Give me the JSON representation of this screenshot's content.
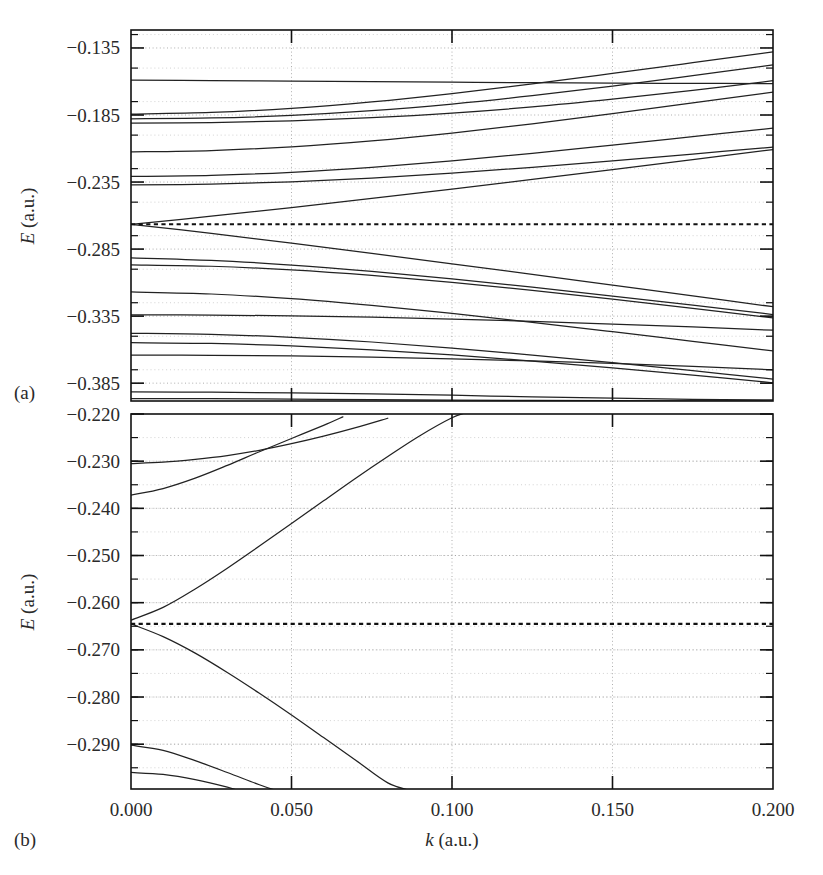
{
  "figure": {
    "panel_a_label": "(a)",
    "panel_b_label": "(b)",
    "xaxis_title_symbol": "k",
    "xaxis_title_units": " (a.u.)",
    "yaxis_title_symbol": "E",
    "yaxis_title_units": " (a.u.)"
  },
  "chart_data": [
    {
      "type": "line",
      "panel": "(a)",
      "title": "",
      "xlabel": "k (a.u.)",
      "ylabel": "E (a.u.)",
      "xlim": [
        0.0,
        0.2
      ],
      "ylim": [
        -0.3983,
        -0.1216
      ],
      "xticks": [
        0.0,
        0.05,
        0.1,
        0.15,
        0.2
      ],
      "xticklabels": [
        "0.000",
        "0.050",
        "0.100",
        "0.150",
        "0.200"
      ],
      "yticks": [
        -0.135,
        -0.185,
        -0.235,
        -0.285,
        -0.335,
        -0.385
      ],
      "yticklabels": [
        "-0.135",
        "-0.185",
        "-0.235",
        "-0.285",
        "-0.335",
        "-0.385"
      ],
      "grid": true,
      "xticks_shown_labels": false,
      "fermi_level": -0.2665,
      "fermi_style": "dotted",
      "series": [
        {
          "name": "band-1",
          "x": [
            0.0,
            0.025,
            0.05,
            0.075,
            0.1,
            0.125,
            0.15,
            0.175,
            0.2
          ],
          "y": [
            -0.159,
            -0.1593,
            -0.1597,
            -0.1601,
            -0.1605,
            -0.1609,
            -0.1612,
            -0.1614,
            -0.1616
          ]
        },
        {
          "name": "band-2",
          "x": [
            0.0,
            0.025,
            0.05,
            0.075,
            0.1,
            0.125,
            0.15,
            0.175,
            0.2
          ],
          "y": [
            -0.1843,
            -0.1831,
            -0.18,
            -0.1752,
            -0.169,
            -0.1618,
            -0.154,
            -0.146,
            -0.1379
          ]
        },
        {
          "name": "band-3",
          "x": [
            0.0,
            0.025,
            0.05,
            0.075,
            0.1,
            0.125,
            0.15,
            0.175,
            0.2
          ],
          "y": [
            -0.1878,
            -0.1872,
            -0.1853,
            -0.1818,
            -0.1768,
            -0.1706,
            -0.1634,
            -0.1556,
            -0.1476
          ]
        },
        {
          "name": "band-4",
          "x": [
            0.0,
            0.025,
            0.05,
            0.075,
            0.1,
            0.125,
            0.15,
            0.175,
            0.2
          ],
          "y": [
            -0.191,
            -0.1906,
            -0.1893,
            -0.187,
            -0.1836,
            -0.179,
            -0.1732,
            -0.1666,
            -0.1594
          ]
        },
        {
          "name": "band-5",
          "x": [
            0.0,
            0.025,
            0.05,
            0.075,
            0.1,
            0.125,
            0.15,
            0.175,
            0.2
          ],
          "y": [
            -0.2125,
            -0.2115,
            -0.2087,
            -0.2043,
            -0.1985,
            -0.1916,
            -0.184,
            -0.176,
            -0.1679
          ]
        },
        {
          "name": "band-6",
          "x": [
            0.0,
            0.025,
            0.05,
            0.075,
            0.1,
            0.125,
            0.15,
            0.175,
            0.2
          ],
          "y": [
            -0.2308,
            -0.23,
            -0.2277,
            -0.224,
            -0.2192,
            -0.2136,
            -0.2074,
            -0.2011,
            -0.1948
          ]
        },
        {
          "name": "band-7",
          "x": [
            0.0,
            0.025,
            0.05,
            0.075,
            0.1,
            0.125,
            0.15,
            0.175,
            0.2
          ],
          "y": [
            -0.2372,
            -0.2366,
            -0.2349,
            -0.2321,
            -0.2284,
            -0.224,
            -0.2192,
            -0.2141,
            -0.209
          ]
        },
        {
          "name": "band-8",
          "x": [
            0.0,
            0.025,
            0.05,
            0.075,
            0.1,
            0.125,
            0.15,
            0.175,
            0.2
          ],
          "y": [
            -0.2665,
            -0.2605,
            -0.254,
            -0.2472,
            -0.2402,
            -0.233,
            -0.2257,
            -0.2183,
            -0.2108
          ]
        },
        {
          "name": "band-9",
          "x": [
            0.0,
            0.025,
            0.05,
            0.075,
            0.1,
            0.125,
            0.15,
            0.175,
            0.2
          ],
          "y": [
            -0.2665,
            -0.2733,
            -0.2806,
            -0.2882,
            -0.296,
            -0.3039,
            -0.3119,
            -0.3199,
            -0.328
          ]
        },
        {
          "name": "band-10",
          "x": [
            0.0,
            0.025,
            0.05,
            0.075,
            0.1,
            0.125,
            0.15,
            0.175,
            0.2
          ],
          "y": [
            -0.2915,
            -0.2934,
            -0.2969,
            -0.3016,
            -0.3072,
            -0.3134,
            -0.32,
            -0.3268,
            -0.3338
          ]
        },
        {
          "name": "band-11",
          "x": [
            0.0,
            0.025,
            0.05,
            0.075,
            0.1,
            0.125,
            0.15,
            0.175,
            0.2
          ],
          "y": [
            -0.2967,
            -0.2978,
            -0.3005,
            -0.3046,
            -0.3098,
            -0.3158,
            -0.3223,
            -0.3292,
            -0.3363
          ]
        },
        {
          "name": "band-12",
          "x": [
            0.0,
            0.025,
            0.05,
            0.075,
            0.1,
            0.125,
            0.15,
            0.175,
            0.2
          ],
          "y": [
            -0.317,
            -0.3185,
            -0.322,
            -0.327,
            -0.333,
            -0.3396,
            -0.3466,
            -0.3538,
            -0.361
          ]
        },
        {
          "name": "band-13",
          "x": [
            0.0,
            0.025,
            0.05,
            0.075,
            0.1,
            0.125,
            0.15,
            0.175,
            0.2
          ],
          "y": [
            -0.334,
            -0.3342,
            -0.3348,
            -0.3358,
            -0.3372,
            -0.3389,
            -0.3409,
            -0.3431,
            -0.3455
          ]
        },
        {
          "name": "band-14",
          "x": [
            0.0,
            0.025,
            0.05,
            0.075,
            0.1,
            0.125,
            0.15,
            0.175,
            0.2
          ],
          "y": [
            -0.3478,
            -0.3486,
            -0.3508,
            -0.3543,
            -0.3588,
            -0.364,
            -0.3697,
            -0.3757,
            -0.3819
          ]
        },
        {
          "name": "band-15",
          "x": [
            0.0,
            0.025,
            0.05,
            0.075,
            0.1,
            0.125,
            0.15,
            0.175,
            0.2
          ],
          "y": [
            -0.3548,
            -0.3554,
            -0.3572,
            -0.3601,
            -0.3639,
            -0.3685,
            -0.3736,
            -0.379,
            -0.3847
          ]
        },
        {
          "name": "band-16",
          "x": [
            0.0,
            0.025,
            0.05,
            0.075,
            0.1,
            0.125,
            0.15,
            0.175,
            0.2
          ],
          "y": [
            -0.364,
            -0.3642,
            -0.3647,
            -0.3656,
            -0.3668,
            -0.3684,
            -0.3703,
            -0.3725,
            -0.375
          ]
        },
        {
          "name": "band-17",
          "x": [
            0.0,
            0.025,
            0.05,
            0.075,
            0.1,
            0.125,
            0.15,
            0.175,
            0.2
          ],
          "y": [
            -0.3915,
            -0.3917,
            -0.3922,
            -0.393,
            -0.394,
            -0.3952,
            -0.3962,
            -0.397,
            -0.3975
          ]
        },
        {
          "name": "band-18",
          "x": [
            0.0,
            0.025,
            0.05,
            0.075,
            0.1,
            0.125,
            0.15,
            0.175,
            0.2
          ],
          "y": [
            -0.3965,
            -0.3966,
            -0.3969,
            -0.3972,
            -0.3976,
            -0.3979,
            -0.3981,
            -0.3982,
            -0.3983
          ]
        }
      ]
    },
    {
      "type": "line",
      "panel": "(b)",
      "title": "",
      "xlabel": "k (a.u.)",
      "ylabel": "E (a.u.)",
      "xlim": [
        0.0,
        0.2
      ],
      "ylim": [
        -0.2995,
        -0.22
      ],
      "xticks": [
        0.0,
        0.05,
        0.1,
        0.15,
        0.2
      ],
      "xticklabels": [
        "0.000",
        "0.050",
        "0.100",
        "0.150",
        "0.200"
      ],
      "yticks": [
        -0.22,
        -0.23,
        -0.24,
        -0.25,
        -0.26,
        -0.27,
        -0.28,
        -0.29
      ],
      "yticklabels": [
        "-0.220",
        "-0.230",
        "-0.240",
        "-0.250",
        "-0.260",
        "-0.270",
        "-0.280",
        "-0.290"
      ],
      "grid": true,
      "fermi_level": -0.2645,
      "fermi_style": "dotted",
      "series": [
        {
          "name": "band-b1",
          "x": [
            0.0,
            0.01,
            0.02,
            0.03,
            0.04,
            0.05,
            0.06,
            0.07,
            0.08
          ],
          "y": [
            -0.2305,
            -0.2302,
            -0.2296,
            -0.2288,
            -0.2277,
            -0.2263,
            -0.2247,
            -0.2229,
            -0.2209
          ]
        },
        {
          "name": "band-b2",
          "x": [
            0.0,
            0.01,
            0.02,
            0.03,
            0.04,
            0.05,
            0.06,
            0.066
          ],
          "y": [
            -0.2372,
            -0.2358,
            -0.2336,
            -0.2309,
            -0.228,
            -0.2252,
            -0.2224,
            -0.2206
          ]
        },
        {
          "name": "band-b3",
          "x": [
            0.0,
            0.01,
            0.02,
            0.03,
            0.04,
            0.05,
            0.06,
            0.07,
            0.08,
            0.09,
            0.1,
            0.105
          ],
          "y": [
            -0.2637,
            -0.261,
            -0.2571,
            -0.2527,
            -0.248,
            -0.2432,
            -0.2384,
            -0.2336,
            -0.229,
            -0.2246,
            -0.2208,
            -0.2196
          ]
        },
        {
          "name": "band-b4",
          "x": [
            0.0,
            0.01,
            0.02,
            0.03,
            0.04,
            0.05,
            0.06,
            0.07,
            0.08,
            0.088
          ],
          "y": [
            -0.2645,
            -0.2672,
            -0.2707,
            -0.2748,
            -0.2792,
            -0.2838,
            -0.2886,
            -0.2934,
            -0.2982,
            -0.3
          ]
        },
        {
          "name": "band-b5",
          "x": [
            0.0,
            0.01,
            0.02,
            0.03,
            0.04,
            0.046
          ],
          "y": [
            -0.2902,
            -0.2913,
            -0.2935,
            -0.296,
            -0.2986,
            -0.3
          ]
        },
        {
          "name": "band-b6",
          "x": [
            0.0,
            0.01,
            0.02,
            0.03,
            0.034
          ],
          "y": [
            -0.296,
            -0.2964,
            -0.2975,
            -0.2991,
            -0.3
          ]
        }
      ]
    }
  ]
}
